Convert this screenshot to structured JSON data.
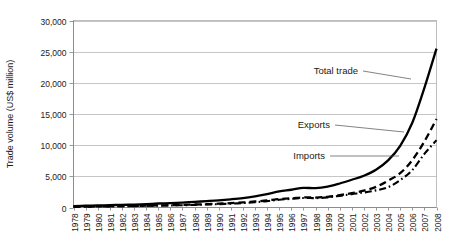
{
  "chart_data": {
    "type": "line",
    "title": "",
    "xlabel": "",
    "ylabel": "Trade volume (US$ million)",
    "ylim": [
      0,
      30000
    ],
    "ytick_labels": [
      "0",
      "5,000",
      "10,000",
      "15,000",
      "20,000",
      "25,000",
      "30,000"
    ],
    "ytick_values": [
      0,
      5000,
      10000,
      15000,
      20000,
      25000,
      30000
    ],
    "grid": true,
    "legend_position": "inline-annotations",
    "categories": [
      "1978",
      "1979",
      "1980",
      "1981",
      "1982",
      "1983",
      "1984",
      "1985",
      "1986",
      "1987",
      "1988",
      "1989",
      "1990",
      "1991",
      "1992",
      "1993",
      "1994",
      "1995",
      "1996",
      "1997",
      "1998",
      "1999",
      "2000",
      "2001",
      "2002",
      "2003",
      "2004",
      "2005",
      "2006",
      "2007",
      "2008"
    ],
    "series": [
      {
        "name": "Total trade",
        "style": "solid",
        "values": [
          230,
          280,
          330,
          380,
          420,
          470,
          540,
          640,
          700,
          790,
          900,
          1020,
          1150,
          1320,
          1520,
          1800,
          2150,
          2600,
          2850,
          3150,
          3100,
          3350,
          3850,
          4450,
          5100,
          6050,
          7550,
          9900,
          13600,
          19200,
          25500
        ]
      },
      {
        "name": "Exports",
        "style": "dashed",
        "values": [
          120,
          150,
          175,
          200,
          225,
          250,
          290,
          340,
          370,
          420,
          480,
          540,
          610,
          700,
          810,
          960,
          1130,
          1350,
          1470,
          1620,
          1600,
          1720,
          1980,
          2300,
          2700,
          3300,
          4300,
          5500,
          7600,
          10600,
          14200
        ]
      },
      {
        "name": "Imports",
        "style": "dash-dot",
        "values": [
          110,
          130,
          155,
          180,
          195,
          220,
          250,
          300,
          330,
          370,
          420,
          480,
          540,
          620,
          710,
          840,
          1020,
          1250,
          1380,
          1530,
          1500,
          1630,
          1870,
          2150,
          2400,
          2750,
          3250,
          4400,
          6000,
          8600,
          10800
        ]
      }
    ],
    "annotations": [
      {
        "text": "Total trade",
        "target_series": "Total trade"
      },
      {
        "text": "Exports",
        "target_series": "Exports"
      },
      {
        "text": "Imports",
        "target_series": "Imports"
      }
    ]
  },
  "colors": {
    "line": "#000000",
    "grid": "#aeaeae",
    "axis": "#7f7f7f",
    "text": "#1a1a1a",
    "background": "#ffffff"
  }
}
